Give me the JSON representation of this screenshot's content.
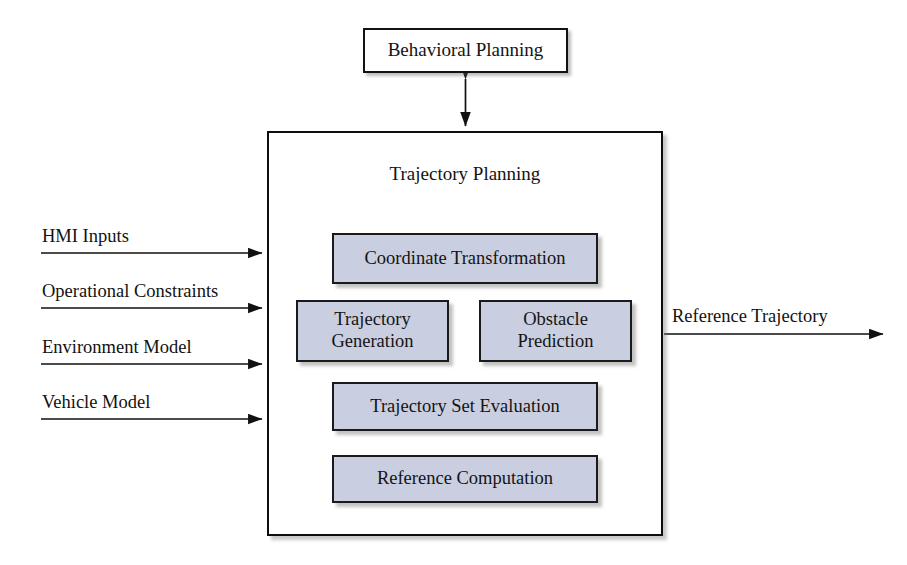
{
  "diagram": {
    "colors": {
      "box_fill": "#c9cee0",
      "box_border": "#1a1a1a",
      "outer_fill": "#ffffff",
      "line": "#111111",
      "background": "#ffffff"
    },
    "external_node": {
      "label": "Behavioral Planning"
    },
    "container": {
      "title": "Trajectory Planning"
    },
    "modules": [
      {
        "id": "coordinate-transformation",
        "label": "Coordinate Transformation"
      },
      {
        "id": "trajectory-generation",
        "label_line1": "Trajectory",
        "label_line2": "Generation"
      },
      {
        "id": "obstacle-prediction",
        "label_line1": "Obstacle",
        "label_line2": "Prediction"
      },
      {
        "id": "trajectory-set-evaluation",
        "label": "Trajectory Set Evaluation"
      },
      {
        "id": "reference-computation",
        "label": "Reference Computation"
      }
    ],
    "inputs": [
      {
        "id": "hmi-inputs",
        "label": "HMI Inputs"
      },
      {
        "id": "operational-constraints",
        "label": "Operational Constraints"
      },
      {
        "id": "environment-model",
        "label": "Environment Model"
      },
      {
        "id": "vehicle-model",
        "label": "Vehicle Model"
      }
    ],
    "outputs": [
      {
        "id": "reference-trajectory",
        "label": "Reference Trajectory"
      }
    ],
    "connections": [
      {
        "from": "behavioral-planning",
        "to": "trajectory-planning-container",
        "arrow": "bidirectional"
      },
      {
        "from": "hmi-inputs",
        "to": "trajectory-planning-container",
        "arrow": "forward"
      },
      {
        "from": "operational-constraints",
        "to": "trajectory-planning-container",
        "arrow": "forward"
      },
      {
        "from": "environment-model",
        "to": "trajectory-planning-container",
        "arrow": "forward"
      },
      {
        "from": "vehicle-model",
        "to": "trajectory-planning-container",
        "arrow": "forward"
      },
      {
        "from": "trajectory-planning-container",
        "to": "reference-trajectory",
        "arrow": "forward"
      }
    ]
  }
}
